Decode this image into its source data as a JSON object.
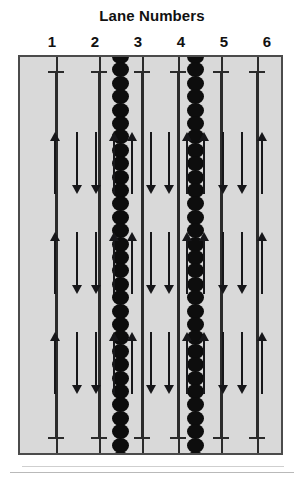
{
  "figure": {
    "title": "Lane Numbers",
    "lane_labels": [
      "1",
      "2",
      "3",
      "4",
      "5",
      "6"
    ],
    "colors": {
      "panel_fill": "#d9d9d9",
      "panel_border": "#4b4b4b",
      "line": "#2b2b2b",
      "arrow": "#17171a",
      "bead": "#0d0d0d",
      "text": "#111111"
    },
    "lanes": [
      {
        "number": "1",
        "label": "1",
        "center_x": 52,
        "arrows": [
          "up"
        ]
      },
      {
        "number": "2",
        "label": "2",
        "center_x": 95,
        "arrows": [
          "down",
          "down"
        ]
      },
      {
        "number": "3",
        "label": "3",
        "center_x": 138,
        "arrows": [
          "up",
          "up"
        ]
      },
      {
        "number": "4",
        "label": "4",
        "center_x": 181,
        "arrows": [
          "down",
          "down"
        ]
      },
      {
        "number": "5",
        "label": "5",
        "center_x": 224,
        "arrows": [
          "up",
          "up"
        ]
      },
      {
        "number": "6",
        "label": "6",
        "center_x": 267,
        "arrows": [
          "down",
          "down",
          "up"
        ]
      }
    ],
    "boundaries": [
      {
        "kind": "plain",
        "x": 36
      },
      {
        "kind": "plain",
        "x": 79
      },
      {
        "kind": "bead",
        "x": 100
      },
      {
        "kind": "plain",
        "x": 122
      },
      {
        "kind": "plain",
        "x": 158
      },
      {
        "kind": "bead",
        "x": 175
      },
      {
        "kind": "plain",
        "x": 201
      },
      {
        "kind": "plain",
        "x": 237
      }
    ],
    "lane_lines_x": [
      36,
      79,
      122,
      158,
      201,
      237
    ],
    "arrow_rows": [
      {
        "name": "row-1",
        "top": 75,
        "height": 62
      },
      {
        "name": "row-2",
        "top": 175,
        "height": 62
      },
      {
        "name": "row-3",
        "top": 275,
        "height": 62
      }
    ],
    "arrow_columns": [
      {
        "name": "lane-1-up",
        "x": 53,
        "dir": "up"
      },
      {
        "name": "lane-2-down-a",
        "x": 85,
        "dir": "down"
      },
      {
        "name": "lane-2-down-b",
        "x": 113,
        "dir": "down"
      },
      {
        "name": "lane-3-up-a",
        "x": 140,
        "dir": "up"
      },
      {
        "name": "lane-3-up-b",
        "x": 167,
        "dir": "up"
      },
      {
        "name": "lane-4-down-a",
        "x": 196,
        "dir": "down"
      },
      {
        "name": "lane-4-down-b",
        "x": 223,
        "dir": "down"
      },
      {
        "name": "lane-5-up-a",
        "x": 250,
        "dir": "up"
      },
      {
        "name": "lane-5-up-b",
        "x": 275,
        "dir": "up"
      },
      {
        "name": "lane-6-down-a",
        "x": 304,
        "dir": "down"
      },
      {
        "name": "lane-6-down-b",
        "x": 332,
        "dir": "down"
      },
      {
        "name": "lane-6-up",
        "x": 361,
        "dir": "up"
      }
    ]
  }
}
